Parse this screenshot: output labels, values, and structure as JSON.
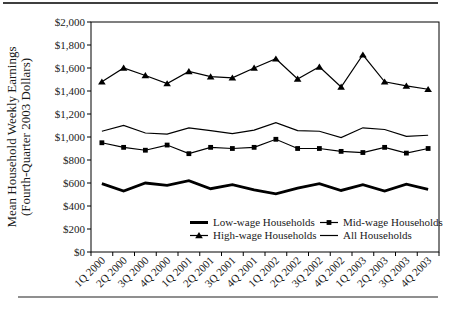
{
  "colors": {
    "line": "#000000",
    "text": "#1a1a1a",
    "top_rule": "#3f3f3f",
    "bottom_rule": "#8f8f8f",
    "background": "#ffffff"
  },
  "chart_data": {
    "type": "line",
    "title": "",
    "ylabel_line1": "Mean Household Weekly Earnings",
    "ylabel_line2": "(Fourth-Quarter 2003 Dollars)",
    "xlabel": "",
    "ylim": [
      0,
      2000
    ],
    "y_tick_step": 200,
    "y_tick_labels": [
      "$0",
      "$200",
      "$400",
      "$600",
      "$800",
      "$1,000",
      "$1,200",
      "$1,400",
      "$1,600",
      "$1,800",
      "$2,000"
    ],
    "grid": false,
    "legend_position": "inside-bottom",
    "categories": [
      "1Q 2000",
      "2Q 2000",
      "3Q 2000",
      "4Q 2000",
      "1Q 2001",
      "2Q 2001",
      "3Q 2001",
      "4Q 2001",
      "1Q 2002",
      "2Q 2002",
      "3Q 2002",
      "4Q 2002",
      "1Q 2003",
      "2Q 2003",
      "3Q 2003",
      "4Q 2003"
    ],
    "series": [
      {
        "name": "Low-wage Households",
        "marker": "none",
        "line": "thick",
        "values": [
          595,
          530,
          600,
          580,
          620,
          550,
          585,
          540,
          505,
          555,
          595,
          535,
          585,
          530,
          590,
          545
        ]
      },
      {
        "name": "Mid-wage Households",
        "marker": "square",
        "line": "thin",
        "values": [
          950,
          910,
          885,
          930,
          855,
          910,
          900,
          910,
          980,
          900,
          900,
          875,
          865,
          910,
          860,
          900
        ]
      },
      {
        "name": "High-wage Households",
        "marker": "triangle",
        "line": "thin",
        "values": [
          1480,
          1600,
          1535,
          1465,
          1570,
          1525,
          1515,
          1600,
          1680,
          1505,
          1610,
          1435,
          1715,
          1480,
          1445,
          1415
        ]
      },
      {
        "name": "All Households",
        "marker": "none",
        "line": "thin",
        "values": [
          1050,
          1100,
          1035,
          1025,
          1080,
          1055,
          1030,
          1060,
          1125,
          1055,
          1050,
          995,
          1080,
          1065,
          1005,
          1015
        ]
      }
    ]
  }
}
